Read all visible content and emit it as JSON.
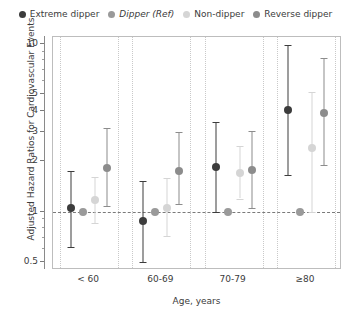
{
  "legend": {
    "position": "top",
    "items": [
      {
        "label": "Extreme dipper",
        "color": "#3c3c3c",
        "italic": false
      },
      {
        "label": "Dipper (Ref)",
        "color": "#9a9a9a",
        "italic": true
      },
      {
        "label": "Non-dipper",
        "color": "#d5d5d5",
        "italic": false
      },
      {
        "label": "Reverse dipper",
        "color": "#8c8c8c",
        "italic": false
      }
    ]
  },
  "chart_data": {
    "type": "scatter",
    "title": "",
    "xlabel": "Age, years",
    "ylabel": "Adjusted Hazard Ratios for Cardiovascular Events",
    "yscale": "log",
    "ylim": [
      0.45,
      11
    ],
    "ytick_labels": [
      "10",
      "5",
      "4",
      "3",
      "2",
      "1",
      "0.5"
    ],
    "ytick_values": [
      10,
      5,
      4,
      3,
      2,
      1,
      0.5
    ],
    "minor_ticks": [
      9,
      8,
      7,
      6,
      0.9,
      0.8,
      0.7,
      0.6
    ],
    "grid": "vertical-dotted-group-separators",
    "reference_line": 1,
    "categories": [
      "< 60",
      "60-69",
      "70-79",
      "≥80"
    ],
    "series": [
      {
        "name": "Extreme dipper",
        "color": "#3c3c3c",
        "values": [
          1.05,
          0.88,
          1.85,
          4.05
        ],
        "ci_low": [
          0.62,
          0.5,
          1.0,
          1.65
        ],
        "ci_high": [
          1.75,
          1.52,
          3.45,
          9.8
        ]
      },
      {
        "name": "Dipper (Ref)",
        "color": "#9a9a9a",
        "values": [
          1.0,
          1.0,
          1.0,
          1.0
        ],
        "ci_low": [
          1.0,
          1.0,
          1.0,
          1.0
        ],
        "ci_high": [
          1.0,
          1.0,
          1.0,
          1.0
        ]
      },
      {
        "name": "Non-dipper",
        "color": "#d5d5d5",
        "values": [
          1.18,
          1.06,
          1.7,
          2.4
        ],
        "ci_low": [
          0.86,
          0.72,
          1.2,
          1.0
        ],
        "ci_high": [
          1.62,
          1.58,
          2.45,
          5.2
        ]
      },
      {
        "name": "Reverse dipper",
        "color": "#8c8c8c",
        "values": [
          1.82,
          1.76,
          1.78,
          3.9
        ],
        "ci_low": [
          1.08,
          1.12,
          1.05,
          1.9
        ],
        "ci_high": [
          3.15,
          3.0,
          3.05,
          8.3
        ]
      }
    ]
  }
}
